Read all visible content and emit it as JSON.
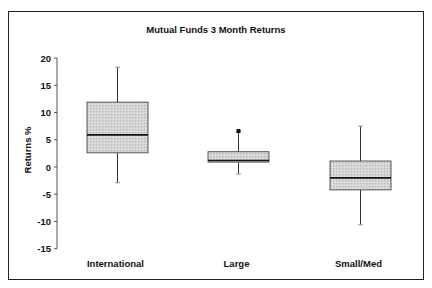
{
  "chart_data": {
    "type": "boxplot",
    "title": "Mutual Funds 3 Month Returns",
    "xlabel": "",
    "ylabel": "Returns %",
    "ylim": [
      -15,
      20
    ],
    "yticks": [
      20,
      15,
      10,
      5,
      0,
      -5,
      -10,
      -15
    ],
    "ytick_labels": [
      "20",
      "15",
      "10",
      "5",
      "0",
      "-5",
      "-10",
      "-15"
    ],
    "grid": false,
    "legend": null,
    "categories": [
      "International",
      "Large",
      "Small/Med"
    ],
    "series": [
      {
        "name": "International",
        "whisker_high": 18.3,
        "q3": 11.9,
        "median": 5.9,
        "q1": 2.6,
        "whisker_low": -2.9,
        "outliers": []
      },
      {
        "name": "Large",
        "whisker_high": 6.5,
        "q3": 2.8,
        "median": 1.2,
        "q1": 0.9,
        "whisker_low": -1.3,
        "outliers": [
          6.6
        ]
      },
      {
        "name": "Small/Med",
        "whisker_high": 7.5,
        "q3": 1.1,
        "median": -2.0,
        "q1": -4.2,
        "whisker_low": -10.6,
        "outliers": []
      }
    ],
    "colors": {
      "box_fill": "#cdcdcd",
      "box_stroke": "#333333",
      "median": "#111111",
      "whisker": "#333333",
      "outlier": "#111111"
    }
  }
}
